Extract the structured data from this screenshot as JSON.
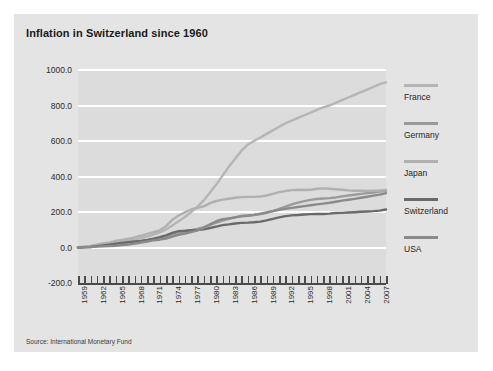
{
  "card": {
    "title": "Inflation in Switzerland since 1960",
    "source": "Source: International Monetary Fund"
  },
  "legend": {
    "position": "right",
    "items": [
      {
        "label": "France",
        "color": "#b5b5b5"
      },
      {
        "label": "Germany",
        "color": "#9a9a9a"
      },
      {
        "label": "Japan",
        "color": "#b0b0b0"
      },
      {
        "label": "Switzerland",
        "color": "#6a6a6a"
      },
      {
        "label": "USA",
        "color": "#8a8a8a"
      }
    ]
  },
  "chart_data": {
    "type": "line",
    "title": "Inflation in Switzerland since 1960",
    "xlabel": "",
    "ylabel": "",
    "ylim": [
      -200,
      1000
    ],
    "yticks": [
      "1000.0",
      "800.0",
      "600.0",
      "400.0",
      "200.0",
      "0.0",
      "-200.0"
    ],
    "ytick_values": [
      1000,
      800,
      600,
      400,
      200,
      0,
      -200
    ],
    "grid": true,
    "xlim": [
      1959,
      2008
    ],
    "xtick_labels": [
      "1959",
      "1962",
      "1965",
      "1968",
      "1971",
      "1974",
      "1977",
      "1980",
      "1983",
      "1986",
      "1989",
      "1992",
      "1995",
      "1998",
      "2001",
      "2004",
      "2007"
    ],
    "xtick_values": [
      1959,
      1962,
      1965,
      1968,
      1971,
      1974,
      1977,
      1980,
      1983,
      1986,
      1989,
      1992,
      1995,
      1998,
      2001,
      2004,
      2007
    ],
    "x": [
      1959,
      1960,
      1961,
      1962,
      1963,
      1964,
      1965,
      1966,
      1967,
      1968,
      1969,
      1970,
      1971,
      1972,
      1973,
      1974,
      1975,
      1976,
      1977,
      1978,
      1979,
      1980,
      1981,
      1982,
      1983,
      1984,
      1985,
      1986,
      1987,
      1988,
      1989,
      1990,
      1991,
      1992,
      1993,
      1994,
      1995,
      1996,
      1997,
      1998,
      1999,
      2000,
      2001,
      2002,
      2003,
      2004,
      2005,
      2006,
      2007,
      2008
    ],
    "series": [
      {
        "name": "France",
        "color": "#b5b5b5",
        "values": [
          0,
          4,
          7,
          12,
          18,
          23,
          27,
          32,
          37,
          44,
          52,
          61,
          72,
          85,
          101,
          124,
          148,
          172,
          200,
          230,
          265,
          310,
          355,
          405,
          455,
          500,
          545,
          580,
          600,
          620,
          640,
          660,
          680,
          700,
          715,
          730,
          745,
          760,
          775,
          790,
          800,
          815,
          830,
          845,
          860,
          875,
          890,
          905,
          920,
          930
        ]
      },
      {
        "name": "Germany",
        "color": "#9a9a9a",
        "values": [
          0,
          2,
          5,
          9,
          12,
          16,
          20,
          24,
          27,
          30,
          34,
          40,
          47,
          54,
          62,
          71,
          80,
          89,
          97,
          105,
          115,
          127,
          140,
          152,
          162,
          170,
          178,
          180,
          183,
          188,
          196,
          205,
          217,
          230,
          243,
          253,
          261,
          268,
          273,
          276,
          278,
          282,
          288,
          293,
          297,
          302,
          306,
          310,
          315,
          320
        ]
      },
      {
        "name": "Japan",
        "color": "#b0b0b0",
        "values": [
          0,
          4,
          9,
          16,
          23,
          29,
          37,
          43,
          49,
          57,
          66,
          77,
          86,
          97,
          120,
          156,
          180,
          198,
          214,
          224,
          232,
          250,
          262,
          270,
          275,
          280,
          284,
          285,
          285,
          287,
          293,
          302,
          312,
          318,
          323,
          325,
          324,
          325,
          331,
          333,
          331,
          328,
          325,
          322,
          320,
          320,
          319,
          320,
          321,
          324
        ]
      },
      {
        "name": "Switzerland",
        "color": "#6a6a6a",
        "values": [
          0,
          1,
          3,
          8,
          12,
          16,
          21,
          26,
          30,
          34,
          37,
          43,
          50,
          58,
          68,
          82,
          92,
          94,
          97,
          98,
          102,
          110,
          118,
          126,
          130,
          135,
          139,
          140,
          142,
          146,
          153,
          161,
          170,
          177,
          181,
          183,
          186,
          188,
          189,
          189,
          191,
          194,
          195,
          197,
          199,
          201,
          203,
          205,
          208,
          214
        ]
      },
      {
        "name": "USA",
        "color": "#8a8a8a",
        "values": [
          0,
          2,
          3,
          5,
          7,
          8,
          10,
          14,
          17,
          22,
          28,
          34,
          40,
          44,
          50,
          61,
          71,
          79,
          87,
          97,
          111,
          130,
          148,
          160,
          164,
          170,
          176,
          179,
          184,
          190,
          197,
          205,
          212,
          218,
          223,
          228,
          233,
          238,
          243,
          247,
          252,
          258,
          264,
          269,
          274,
          280,
          286,
          292,
          298,
          306
        ]
      }
    ]
  }
}
